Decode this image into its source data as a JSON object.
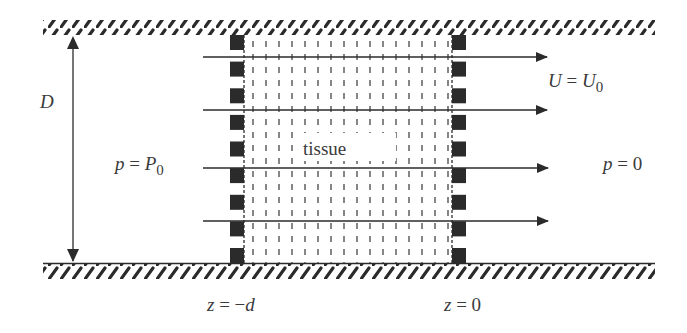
{
  "diagram": {
    "labels": {
      "height": "D",
      "inlet_pressure_lhs": "p = P",
      "inlet_pressure_sub": "0",
      "outlet_pressure": "p = 0",
      "velocity_lhs": "U = U",
      "velocity_sub": "0",
      "tissue": "tissue",
      "left_boundary": "z = −d",
      "right_boundary": "z = 0"
    },
    "flow_arrows": 4,
    "porous_blocks_per_side": 9,
    "colors": {
      "ink": "#2b2b2b",
      "text": "#3a3a3a",
      "background": "#ffffff"
    }
  }
}
